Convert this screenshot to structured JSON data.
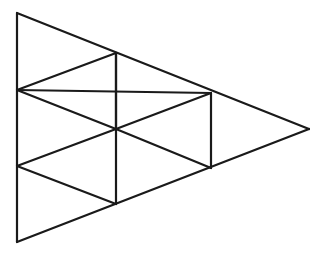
{
  "diagram": {
    "stroke_color": "#1a1a1a",
    "background": "#ffffff",
    "vertices": {
      "A": [
        17,
        13
      ],
      "B": [
        17,
        90
      ],
      "C": [
        17,
        166
      ],
      "D": [
        17,
        242
      ],
      "E": [
        116,
        53
      ],
      "F": [
        116,
        129
      ],
      "G": [
        116,
        204
      ],
      "H": [
        211,
        93
      ],
      "I": [
        211,
        168
      ],
      "J": [
        309,
        129
      ]
    },
    "edges": [
      [
        "A",
        "D"
      ],
      [
        "A",
        "J"
      ],
      [
        "D",
        "J"
      ],
      [
        "E",
        "G"
      ],
      [
        "H",
        "I"
      ],
      [
        "B",
        "E"
      ],
      [
        "B",
        "H"
      ],
      [
        "C",
        "F"
      ],
      [
        "C",
        "G"
      ],
      [
        "F",
        "H"
      ],
      [
        "F",
        "I"
      ],
      [
        "B",
        "F"
      ],
      [
        "E",
        "F"
      ]
    ],
    "small_triangle_count": 9
  }
}
